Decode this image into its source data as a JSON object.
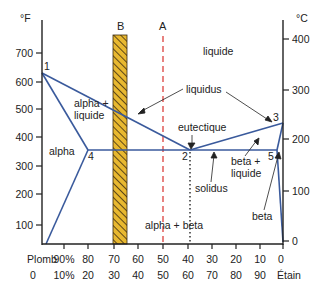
{
  "axes": {
    "left_unit": "°F",
    "right_unit": "°C",
    "left_ticks": [
      "700",
      "600",
      "500",
      "400",
      "300",
      "200",
      "100"
    ],
    "right_ticks": [
      "400",
      "300",
      "200",
      "100",
      "0"
    ],
    "bottom_row1": [
      "Plomb",
      "90%",
      "80",
      "70",
      "60",
      "50",
      "40",
      "30",
      "20",
      "10",
      "0"
    ],
    "bottom_row2": [
      "0",
      "10%",
      "20",
      "30",
      "40",
      "50",
      "60",
      "70",
      "80",
      "90",
      "Étain"
    ]
  },
  "markers": {
    "bar_b": "B",
    "line_a": "A"
  },
  "points": {
    "p1": "1",
    "p2": "2",
    "p3": "3",
    "p4": "4",
    "p5": "5"
  },
  "regions": {
    "liquid": "liquide",
    "alpha_liquid_1": "alpha +",
    "alpha_liquid_2": "liquide",
    "alpha": "alpha",
    "beta_liquid_1": "beta +",
    "beta_liquid_2": "liquide",
    "alpha_beta": "alpha + beta",
    "beta": "beta"
  },
  "annotations": {
    "liquidus": "liquidus",
    "eutectic": "eutectique",
    "solidus": "solidus"
  },
  "colors": {
    "phase_line": "#3a5a9c",
    "line_a": "#d9302c",
    "bar_fill": "#e8b830",
    "axis": "#222222"
  }
}
